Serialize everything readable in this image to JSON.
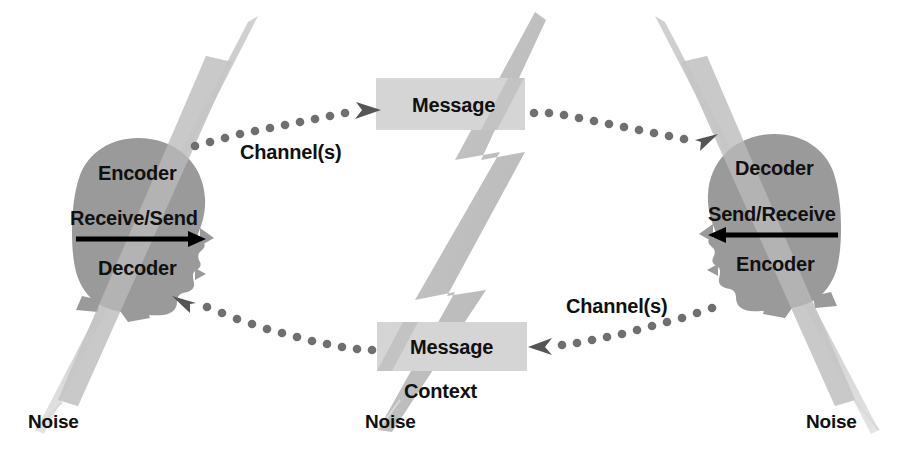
{
  "diagram": {
    "colors": {
      "background": "#ffffff",
      "head_fill": "#9a9a9a",
      "message_fill": "#d5d5d5",
      "noise_streak": "#bdbdbd",
      "lightning_fill": "#bdbdbd",
      "dot_color": "#6f6f6f",
      "arrow_color": "#000000",
      "text_color": "#101010"
    }
  },
  "left_person": {
    "top_label": "Encoder",
    "middle_label": "Receive/Send",
    "bottom_label": "Decoder",
    "arrow_direction": "right",
    "icon": "head-silhouette-facing-right"
  },
  "right_person": {
    "top_label": "Decoder",
    "middle_label": "Send/Receive",
    "bottom_label": "Encoder",
    "arrow_direction": "left",
    "icon": "head-silhouette-facing-left"
  },
  "messages": {
    "top": "Message",
    "bottom": "Message"
  },
  "context": {
    "label": "Context"
  },
  "channels": {
    "upper": "Channel(s)",
    "lower": "Channel(s)"
  },
  "noise": {
    "left": "Noise",
    "center": "Noise",
    "right": "Noise"
  }
}
